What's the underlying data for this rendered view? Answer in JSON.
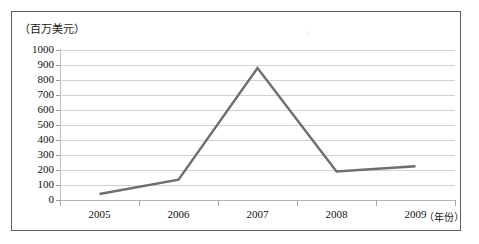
{
  "chart_data": {
    "type": "line",
    "title": "",
    "subtitle": "",
    "ylabel": "（百万美元）",
    "xlabel": "（年份）",
    "categories": [
      "2005",
      "2006",
      "2007",
      "2008",
      "2009"
    ],
    "x": [
      2005,
      2006,
      2007,
      2008,
      2009
    ],
    "series": [
      {
        "name": "",
        "values": [
          40,
          135,
          880,
          190,
          225
        ],
        "color": "#6e6e6e"
      }
    ],
    "ylim": [
      0,
      1000
    ],
    "ytick_step": 100,
    "ytick_labels": [
      "1000",
      "900",
      "800",
      "700",
      "600",
      "500",
      "400",
      "300",
      "200",
      "100",
      "0"
    ],
    "ytick_values": [
      1000,
      900,
      800,
      700,
      600,
      500,
      400,
      300,
      200,
      100,
      0
    ],
    "xtick_labels": [
      "2005",
      "2006",
      "2007",
      "2008",
      "2009"
    ],
    "grid": true,
    "grid_axis": "y",
    "legend": false,
    "legend_position": "none",
    "annotations": [],
    "colors": {
      "series_line": "#6e6e6e",
      "gridline": "#d2d2d2",
      "axis": "#bdbdbd",
      "frame": "#5d5d5d",
      "text": "#111111",
      "background": "#ffffff"
    }
  }
}
